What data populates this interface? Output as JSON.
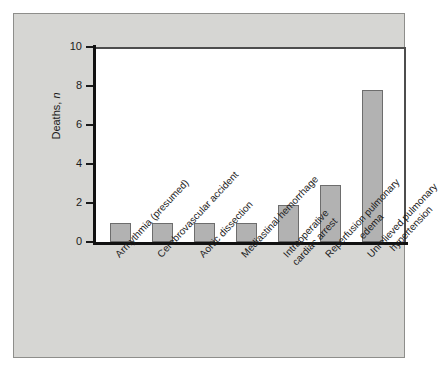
{
  "chart_data": {
    "type": "bar",
    "title": "",
    "subtitle": "",
    "xlabel": "",
    "ylabel": "Deaths, n",
    "ylabel_plain": "Deaths,",
    "ylabel_italic": "n",
    "ylim": [
      0,
      10
    ],
    "yticks": [
      0,
      2,
      4,
      6,
      8,
      10
    ],
    "ytick_labels": [
      "0",
      "2",
      "4",
      "6",
      "8",
      "10"
    ],
    "grid": false,
    "legend": null,
    "categories": [
      "Arrhythmia (presumed)",
      "Cerebrovascular accident",
      "Aortic dissection",
      "Mediastinal hemorrhage",
      "Intraoperative cardiac arrest",
      "Reperfusion pulmonary edema",
      "Unrelieved pulmonary hypertension"
    ],
    "category_lines": [
      [
        "Arrhythmia (presumed)"
      ],
      [
        "Cerebrovascular accident"
      ],
      [
        "Aortic dissection"
      ],
      [
        "Mediastinal hemorrhage"
      ],
      [
        "Intraoperative",
        "cardiac arrest"
      ],
      [
        "Reperfusion pulmonary",
        "edema"
      ],
      [
        "Unrelieved pulmonary",
        "hypertension"
      ]
    ],
    "values": [
      1,
      1,
      1,
      1,
      1.9,
      2.9,
      7.8
    ],
    "bar_color": "#b2b2b2",
    "bar_edge_color": "#6d6d6d",
    "axis_color": "#111111",
    "panel_color": "#d6d6d3",
    "plot_bg_color": "#ffffff"
  }
}
